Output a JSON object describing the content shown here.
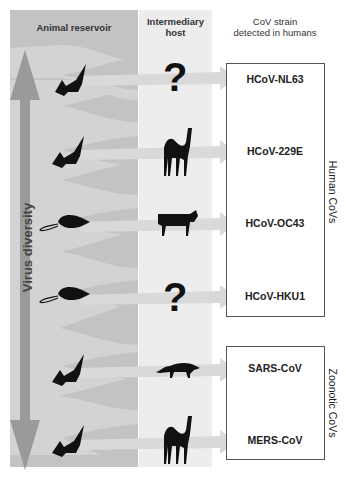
{
  "headers": {
    "animal_reservoir": "Animal reservoir",
    "intermediary_host_line1": "Intermediary",
    "intermediary_host_line2": "host",
    "strain_line1": "CoV strain",
    "strain_line2": "detected in humans"
  },
  "axis": {
    "label": "Virus diversity"
  },
  "groups": {
    "human": {
      "label": "Human CoVs"
    },
    "zoonotic": {
      "label": "Zoonotic CoVs"
    }
  },
  "rows": [
    {
      "reservoir": "bat",
      "intermediate": "unknown",
      "question": "?",
      "strain": "HCoV-NL63"
    },
    {
      "reservoir": "bat",
      "intermediate": "camel",
      "strain": "HCoV-229E"
    },
    {
      "reservoir": "rodent",
      "intermediate": "cattle",
      "strain": "HCoV-OC43"
    },
    {
      "reservoir": "rodent",
      "intermediate": "unknown",
      "question": "?",
      "strain": "HCoV-HKU1"
    },
    {
      "reservoir": "bat",
      "intermediate": "civet",
      "strain": "SARS-CoV"
    },
    {
      "reservoir": "bat",
      "intermediate": "camel",
      "strain": "MERS-CoV"
    }
  ],
  "colors": {
    "reservoir_bg": "#c3c3c3",
    "stream": "#d6d6d6",
    "intermediary_bg": "#ededed",
    "arrow": "#dadada",
    "diversity_arrow": "#9a9a9a"
  }
}
